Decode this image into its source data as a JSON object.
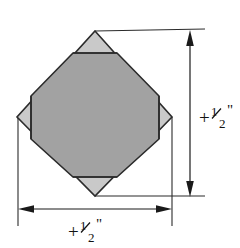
{
  "figure": {
    "background_color": "#ffffff",
    "line_color": "#1a1a1a",
    "shape": {
      "name": "diamond-with-inscribed-octagon",
      "outer_color": "#c9c9c9",
      "inner_color": "#a2a2a2",
      "outline_color": "#2b2b2b",
      "outer_label": "corner-triangle",
      "inner_label": "octagon-face",
      "vertices": {
        "top": [
          95,
          31
        ],
        "right": [
          172,
          117
        ],
        "bottom": [
          95,
          196
        ],
        "left": [
          17,
          117
        ]
      }
    },
    "dimensions": {
      "vertical": {
        "name": "vertical-dimension",
        "value": "+",
        "numerator": "1",
        "denominator": "2",
        "unit": "\"",
        "full_text": "+1/2\"",
        "orientation": "vertical",
        "arrow_top_y": 31,
        "arrow_bottom_y": 196,
        "line_x": 190,
        "label_x": 198,
        "label_y": 117
      },
      "horizontal": {
        "name": "horizontal-dimension",
        "value": "+",
        "numerator": "1",
        "denominator": "2",
        "unit": "\"",
        "full_text": "+1/2\"",
        "orientation": "horizontal",
        "arrow_left_x": 18,
        "arrow_right_x": 172,
        "line_y": 209,
        "label_x": 95,
        "label_y": 234
      }
    },
    "extension_lines": {
      "name": "extension-lines",
      "color": "#2b2b2b"
    }
  }
}
